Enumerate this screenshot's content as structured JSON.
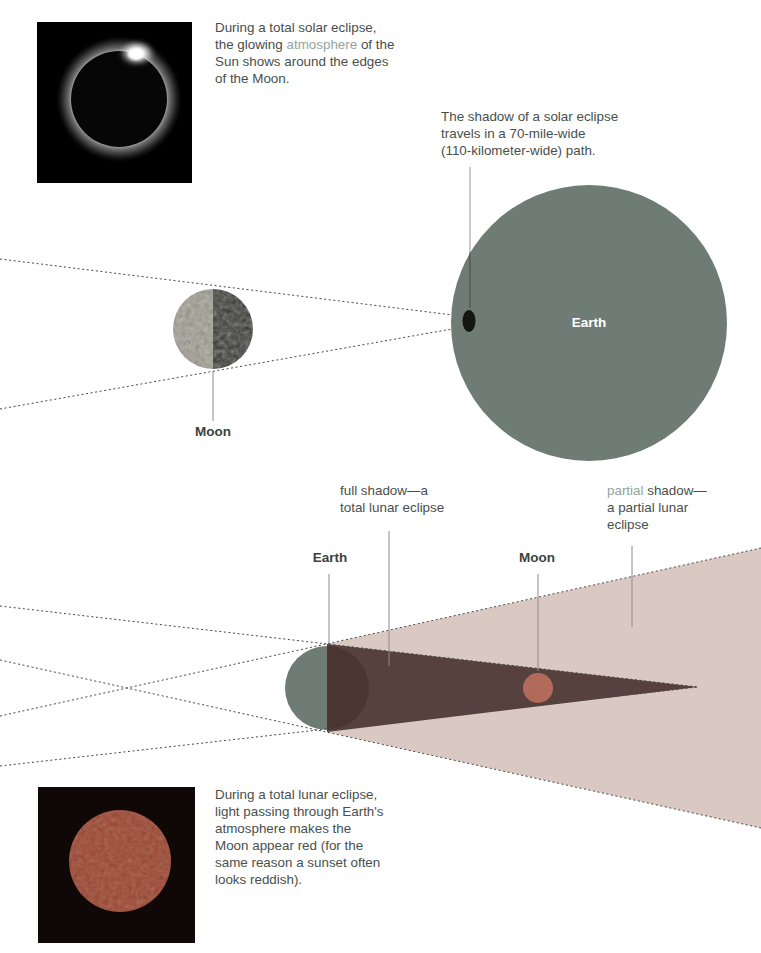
{
  "colors": {
    "text_dark": "#474F4D",
    "text_highlight": "#92A5A1",
    "label_dark": "#3A423F",
    "earth_fill": "#6F7B75",
    "earth_night": "#4A3532",
    "umbra": "#57413E",
    "penumbra": "#DAC9C3",
    "moon_light": "#9A978D",
    "moon_dark": "#454540",
    "moon_red": "#B26B5B",
    "photo_moon_red": "#9A4B37",
    "leader": "#8C8C8C",
    "dotted": "#474747"
  },
  "captions": {
    "solar_photo": [
      [
        {
          "text": "During a total solar eclipse,"
        }
      ],
      [
        {
          "text": "the glowing "
        },
        {
          "text": "atmosphere",
          "hl": true
        },
        {
          "text": " of the"
        }
      ],
      [
        {
          "text": "Sun shows around the edges"
        }
      ],
      [
        {
          "text": "of the Moon."
        }
      ]
    ],
    "solar_shadow": [
      [
        {
          "text": "The shadow of a solar eclipse"
        }
      ],
      [
        {
          "text": "travels in a 70-mile-wide"
        }
      ],
      [
        {
          "text": "(110-kilometer-wide) path."
        }
      ]
    ],
    "full_shadow": [
      [
        {
          "text": "full shadow—a"
        }
      ],
      [
        {
          "text": "total lunar eclipse"
        }
      ]
    ],
    "partial_shadow": [
      [
        {
          "text": "partial",
          "hl": true
        },
        {
          "text": " shadow—"
        }
      ],
      [
        {
          "text": "a partial lunar"
        }
      ],
      [
        {
          "text": "eclipse"
        }
      ]
    ],
    "lunar_photo": [
      [
        {
          "text": "During a total lunar eclipse,"
        }
      ],
      [
        {
          "text": "light passing through Earth's"
        }
      ],
      [
        {
          "text": "atmosphere makes the"
        }
      ],
      [
        {
          "text": "Moon appear red (for the"
        }
      ],
      [
        {
          "text": "same reason a sunset often"
        }
      ],
      [
        {
          "text": "looks reddish)."
        }
      ]
    ]
  },
  "labels": {
    "earth_solar": "Earth",
    "moon_solar": "Moon",
    "earth_lunar": "Earth",
    "moon_lunar": "Moon"
  }
}
